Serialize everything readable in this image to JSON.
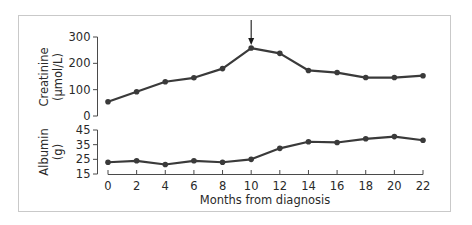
{
  "chart_data": {
    "type": "line",
    "title": "",
    "xlabel": "Months from diagnosis",
    "x": [
      0,
      2,
      4,
      6,
      8,
      10,
      12,
      14,
      16,
      18,
      20,
      22
    ],
    "xlim": [
      0,
      22
    ],
    "xticks": [
      "0",
      "2",
      "4",
      "6",
      "8",
      "10",
      "12",
      "14",
      "16",
      "18",
      "20",
      "22"
    ],
    "panels": [
      {
        "name": "Creatinine",
        "ylabel_line1": "Creatinine",
        "ylabel_line2": "(µmol/L)",
        "ylim": [
          0,
          300
        ],
        "yticks": [
          "0",
          "100",
          "200",
          "300"
        ],
        "series": [
          {
            "name": "Creatinine (µmol/L)",
            "values": [
              54,
              92,
              130,
              145,
              180,
              258,
              238,
              173,
              165,
              146,
              146,
              153
            ]
          }
        ]
      },
      {
        "name": "Albumin",
        "ylabel_line1": "Albumin",
        "ylabel_line2": "(g)",
        "ylim": [
          15,
          45
        ],
        "yticks": [
          "15",
          "25",
          "35",
          "45"
        ],
        "series": [
          {
            "name": "Albumin (g)",
            "values": [
              23,
              24,
              21.5,
              24,
              23,
              25,
              32.5,
              37,
              36.5,
              39,
              40.5,
              38
            ]
          }
        ]
      }
    ],
    "annotations": [
      {
        "type": "arrow",
        "x": 10,
        "panel": "Creatinine",
        "direction": "down",
        "label": ""
      }
    ],
    "grid": false,
    "legend": "none",
    "colors": {
      "line": "#3a3a3a",
      "marker": "#3a3a3a",
      "axis": "#4a4a4a",
      "frame": "#c9c9c9"
    }
  }
}
